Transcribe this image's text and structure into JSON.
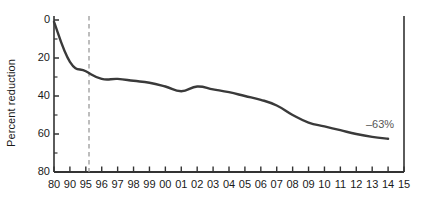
{
  "chart_data": {
    "type": "line",
    "title": "",
    "xlabel": "",
    "ylabel": "Percent reduction",
    "ylim": [
      0,
      80
    ],
    "y_inverted": true,
    "grid": false,
    "legend": "none",
    "y_ticks": [
      0,
      20,
      40,
      60,
      80
    ],
    "y_tick_labels": [
      "0",
      "20",
      "40",
      "60",
      "80"
    ],
    "y_minor_ticks": [
      10,
      30,
      50,
      70
    ],
    "categories": [
      "80",
      "90",
      "95",
      "96",
      "97",
      "98",
      "99",
      "00",
      "01",
      "02",
      "03",
      "04",
      "05",
      "06",
      "07",
      "08",
      "09",
      "10",
      "11",
      "12",
      "13",
      "14",
      "15"
    ],
    "series": [
      {
        "name": "Percent reduction",
        "color": "#3a3a3a",
        "values": [
          -1,
          -22,
          -27,
          -31,
          -31,
          -32,
          -33,
          -35,
          -37.5,
          -35,
          -36.5,
          -38,
          -40,
          -42,
          -45,
          -50,
          -54,
          -56,
          -58,
          -60,
          -61.5,
          -62.5,
          null
        ]
      }
    ],
    "reference_line": {
      "name": "vertical-dashed-1995",
      "x_category": "95",
      "style": "dashed",
      "color": "#999999"
    },
    "right_axis_line": {
      "x_category": "15",
      "color": "#333333"
    },
    "annotations": [
      {
        "name": "end-value-label",
        "text": "–63%",
        "x_category": "13",
        "value": -63
      }
    ]
  },
  "axis": {
    "y_title": "Percent reduction"
  }
}
